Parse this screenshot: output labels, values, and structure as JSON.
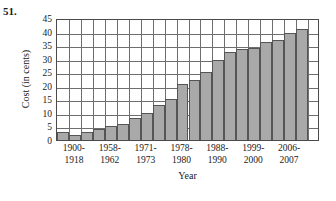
{
  "problem": {
    "number": "51."
  },
  "chart_data": {
    "type": "bar",
    "title": "",
    "xlabel": "Year",
    "ylabel": "Cost (in cents)",
    "ylim": [
      0,
      45
    ],
    "ytick_labels": [
      "0",
      "5",
      "10",
      "15",
      "20",
      "25",
      "30",
      "35",
      "40",
      "45"
    ],
    "ytick_values": [
      0,
      5,
      10,
      15,
      20,
      25,
      30,
      35,
      40,
      45
    ],
    "grid": true,
    "legend": "none",
    "x_group_labels": [
      {
        "line1": "1900-",
        "line2": "1918"
      },
      {
        "line1": "1958-",
        "line2": "1962"
      },
      {
        "line1": "1971-",
        "line2": "1973"
      },
      {
        "line1": "1978-",
        "line2": "1980"
      },
      {
        "line1": "1988-",
        "line2": "1990"
      },
      {
        "line1": "1999-",
        "line2": "2000"
      },
      {
        "line1": "2006-",
        "line2": "2007"
      }
    ],
    "categories": [
      "1900-1918",
      "1919-1932",
      "1933-1957",
      "1958-1962",
      "1963-1967",
      "1968-1970",
      "1971-1973",
      "1974-1975",
      "1976-1977",
      "1978-1980",
      "1981",
      "1982-1984",
      "1985-1987",
      "1988-1990",
      "1991-1994",
      "1995-1998",
      "1999-2000",
      "2001-2001",
      "2002-2005",
      "2006",
      "2007",
      "2008"
    ],
    "values": [
      3,
      2,
      3,
      4,
      5,
      6,
      8,
      10,
      13,
      15,
      20.5,
      22,
      25,
      29.5,
      32.5,
      33.5,
      34,
      36,
      37,
      39.5,
      41,
      0
    ],
    "bar_color": "#a9a9a9",
    "bar_edge_color": "#555555",
    "grid_color": "#6e6e6e",
    "axis_color": "#4a4a4a"
  }
}
